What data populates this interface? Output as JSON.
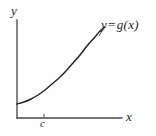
{
  "figure": {
    "kind": "cartesian-graph",
    "background_color": "#fefefe",
    "ink_color": "#232323",
    "axis_color": "#4a4a4a",
    "labels": {
      "y_axis": "y",
      "x_axis": "x",
      "tick_c": "c",
      "function_lhs": "y",
      "function_operator": "=",
      "function_rhs": "g(x)",
      "function_full": "y = g(x)"
    }
  },
  "chart_data": {
    "type": "line",
    "title": "",
    "subtitle": "",
    "xlabel": "x",
    "ylabel": "y",
    "legend": [
      "y = g(x)"
    ],
    "legend_position": "inline-end-of-curve",
    "grid": false,
    "annotations": [
      {
        "name": "curve-label",
        "text": "y = g(x)",
        "x": 0.92,
        "y": 0.93
      },
      {
        "name": "x-tick-label",
        "text": "c",
        "x": 0.26,
        "y": 0.0
      }
    ],
    "axes": {
      "x_origin_px": 17,
      "y_origin_px": 118,
      "x_axis_end_px": 122,
      "y_axis_top_px": 20,
      "xlim": [
        0,
        1
      ],
      "ylim": [
        0,
        1
      ],
      "ticks_x": [
        {
          "value": 0.26,
          "label": "c",
          "pixel_x": 44
        }
      ],
      "ticks_y": []
    },
    "series": [
      {
        "name": "y = g(x)",
        "description": "increasing convex curve",
        "color": "#232323",
        "points_px": [
          [
            17,
            104
          ],
          [
            24,
            102
          ],
          [
            31,
            99
          ],
          [
            38,
            95
          ],
          [
            45,
            90
          ],
          [
            52,
            84
          ],
          [
            59,
            78
          ],
          [
            66,
            71
          ],
          [
            73,
            63
          ],
          [
            80,
            55
          ],
          [
            87,
            46
          ],
          [
            94,
            38
          ],
          [
            100,
            31
          ],
          [
            105,
            27
          ]
        ],
        "x": [
          0.0,
          0.07,
          0.13,
          0.2,
          0.27,
          0.33,
          0.4,
          0.47,
          0.53,
          0.6,
          0.67,
          0.73,
          0.79,
          0.84
        ],
        "values": [
          0.14,
          0.16,
          0.19,
          0.23,
          0.29,
          0.35,
          0.41,
          0.48,
          0.56,
          0.64,
          0.73,
          0.82,
          0.89,
          0.93
        ]
      }
    ]
  }
}
